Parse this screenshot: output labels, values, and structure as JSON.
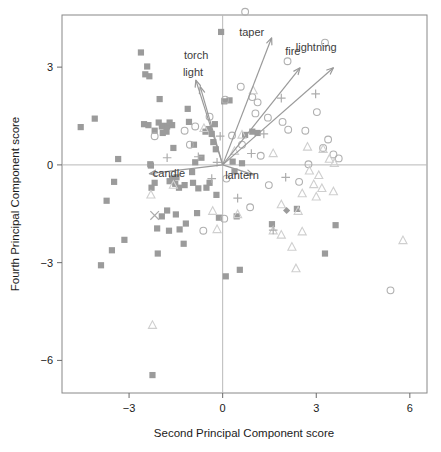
{
  "chart_data": {
    "type": "scatter",
    "title": "",
    "subtitle": "",
    "xlabel": "Second Principal Component score",
    "ylabel": "Fourth Principal Component score",
    "xlim": [
      -5.15,
      6.55
    ],
    "ylim": [
      -7.0,
      4.6
    ],
    "xticks": [
      -3,
      0,
      3,
      6
    ],
    "xtick_labels": [
      "−3",
      "0",
      "3",
      "6"
    ],
    "yticks": [
      3,
      0,
      -3,
      -6
    ],
    "ytick_labels": [
      "3",
      "0",
      "−3",
      "−6"
    ],
    "grid": false,
    "reference_lines": {
      "vertical_x": 0,
      "horizontal_y": 0,
      "color": "#b9b9b9"
    },
    "legend": {
      "position": "none",
      "entries": []
    },
    "annotations": [
      {
        "text": "torch",
        "x": -0.85,
        "y": 3.25
      },
      {
        "text": "light",
        "x": -0.95,
        "y": 2.72
      },
      {
        "text": "taper",
        "x": 0.93,
        "y": 3.95
      },
      {
        "text": "fire",
        "x": 2.25,
        "y": 3.37
      },
      {
        "text": "lightning",
        "x": 3.0,
        "y": 3.5
      },
      {
        "text": "candle",
        "x": -1.72,
        "y": -0.38
      },
      {
        "text": "lantern",
        "x": 0.62,
        "y": -0.42
      }
    ],
    "loading_vectors": {
      "origin": [
        0,
        0
      ],
      "color": "#9a9a9a",
      "items": [
        {
          "name": "torch",
          "x": -0.86,
          "y": 2.6
        },
        {
          "name": "light",
          "x": -0.72,
          "y": 2.4
        },
        {
          "name": "taper",
          "x": 1.57,
          "y": 3.9
        },
        {
          "name": "fire",
          "x": 2.48,
          "y": 2.98
        },
        {
          "name": "lightning",
          "x": 3.55,
          "y": 2.98
        },
        {
          "name": "candle",
          "x": -2.35,
          "y": -0.27
        },
        {
          "name": "lantern",
          "x": 0.98,
          "y": -0.3
        }
      ]
    },
    "series": [
      {
        "name": "square",
        "marker": "filled-square",
        "color": "#9b9b9b",
        "points": [
          [
            -4.55,
            1.16
          ],
          [
            -4.1,
            1.42
          ],
          [
            -3.35,
            0.18
          ],
          [
            -3.48,
            -0.52
          ],
          [
            -3.72,
            -1.1
          ],
          [
            -3.55,
            -2.62
          ],
          [
            -3.9,
            -3.08
          ],
          [
            -3.15,
            -2.3
          ],
          [
            -2.62,
            3.45
          ],
          [
            -2.42,
            3.02
          ],
          [
            -2.35,
            2.72
          ],
          [
            -2.48,
            2.78
          ],
          [
            -2.52,
            1.25
          ],
          [
            -2.38,
            1.22
          ],
          [
            -2.3,
            -0.02
          ],
          [
            -2.28,
            -0.7
          ],
          [
            -2.18,
            1.05
          ],
          [
            -2.02,
            2.02
          ],
          [
            -2.05,
            1.3
          ],
          [
            -1.95,
            1.18
          ],
          [
            -1.88,
            1.2
          ],
          [
            -1.78,
            1.18
          ],
          [
            -1.7,
            1.3
          ],
          [
            -1.62,
            1.22
          ],
          [
            -1.92,
            0.98
          ],
          [
            -1.8,
            1.02
          ],
          [
            -1.58,
            0.52
          ],
          [
            -1.52,
            -0.58
          ],
          [
            -1.4,
            -0.7
          ],
          [
            -1.48,
            -0.38
          ],
          [
            -1.62,
            -0.42
          ],
          [
            -1.7,
            -0.5
          ],
          [
            -1.95,
            -1.58
          ],
          [
            -1.78,
            -1.4
          ],
          [
            -2.1,
            -1.95
          ],
          [
            -1.72,
            -2.02
          ],
          [
            -2.08,
            -2.72
          ],
          [
            -1.5,
            -1.52
          ],
          [
            -1.38,
            -1.98
          ],
          [
            -1.25,
            -2.42
          ],
          [
            -1.18,
            -1.8
          ],
          [
            -1.12,
            1.72
          ],
          [
            -1.08,
            1.32
          ],
          [
            -0.92,
            0.62
          ],
          [
            -0.88,
            0.08
          ],
          [
            -0.98,
            -0.22
          ],
          [
            -0.95,
            -0.55
          ],
          [
            -0.82,
            -1.48
          ],
          [
            -0.78,
            -0.72
          ],
          [
            -0.68,
            0.22
          ],
          [
            -0.55,
            1.02
          ],
          [
            -0.45,
            1.1
          ],
          [
            -0.35,
            0.95
          ],
          [
            -0.3,
            0.7
          ],
          [
            -0.25,
            1.25
          ],
          [
            -0.22,
            0.48
          ],
          [
            -0.2,
            -0.92
          ],
          [
            -0.12,
            -1.62
          ],
          [
            -0.05,
            4.08
          ],
          [
            0.05,
            1.95
          ],
          [
            0.1,
            -3.42
          ],
          [
            0.22,
            1.98
          ],
          [
            0.32,
            0.1
          ],
          [
            0.38,
            -0.2
          ],
          [
            0.45,
            -1.58
          ],
          [
            0.55,
            -3.22
          ],
          [
            0.62,
            0.05
          ],
          [
            0.72,
            0.92
          ],
          [
            0.95,
            1.02
          ],
          [
            1.12,
            0.98
          ],
          [
            1.58,
            -1.82
          ],
          [
            2.38,
            -1.35
          ],
          [
            3.28,
            -2.72
          ],
          [
            3.62,
            -1.85
          ],
          [
            -2.25,
            -6.45
          ],
          [
            -0.52,
            -0.7
          ],
          [
            -0.42,
            -0.55
          ],
          [
            -1.22,
            -0.62
          ],
          [
            -2.18,
            -0.55
          ],
          [
            -2.32,
            0.02
          ]
        ]
      },
      {
        "name": "circle",
        "marker": "open-circle",
        "color": "#b0b0b0",
        "points": [
          [
            0.72,
            4.7
          ],
          [
            3.28,
            3.75
          ],
          [
            2.08,
            3.18
          ],
          [
            0.58,
            2.4
          ],
          [
            0.95,
            2.08
          ],
          [
            1.12,
            1.92
          ],
          [
            0.08,
            2.0
          ],
          [
            -0.42,
            1.48
          ],
          [
            -0.88,
            1.18
          ],
          [
            -1.22,
            1.05
          ],
          [
            -2.18,
            0.88
          ],
          [
            -1.05,
            0.62
          ],
          [
            0.3,
            0.9
          ],
          [
            1.05,
            1.58
          ],
          [
            1.45,
            1.45
          ],
          [
            1.92,
            1.32
          ],
          [
            2.1,
            1.08
          ],
          [
            2.65,
            1.05
          ],
          [
            3.02,
            1.62
          ],
          [
            3.38,
            0.78
          ],
          [
            3.22,
            0.52
          ],
          [
            3.55,
            0.32
          ],
          [
            3.72,
            0.2
          ],
          [
            2.75,
            0.02
          ],
          [
            1.48,
            -0.62
          ],
          [
            0.88,
            -1.3
          ],
          [
            0.05,
            -1.65
          ],
          [
            -0.62,
            -2.02
          ],
          [
            5.38,
            -3.85
          ],
          [
            0.12,
            -0.42
          ],
          [
            0.62,
            0.62
          ],
          [
            1.22,
            0.28
          ],
          [
            2.45,
            -0.52
          ]
        ]
      },
      {
        "name": "triangle",
        "marker": "open-triangle",
        "color": "#cfcfcf",
        "points": [
          [
            0.98,
            2.28
          ],
          [
            -0.6,
            1.12
          ],
          [
            0.62,
            0.92
          ],
          [
            0.38,
            0.42
          ],
          [
            1.62,
            0.35
          ],
          [
            2.72,
            0.55
          ],
          [
            3.22,
            0.48
          ],
          [
            3.42,
            0.18
          ],
          [
            3.58,
            0.05
          ],
          [
            2.78,
            -0.18
          ],
          [
            3.08,
            -0.32
          ],
          [
            2.92,
            -0.6
          ],
          [
            3.18,
            -0.72
          ],
          [
            3.55,
            -0.82
          ],
          [
            2.55,
            -0.88
          ],
          [
            1.88,
            -1.22
          ],
          [
            2.42,
            -1.42
          ],
          [
            1.62,
            -2.02
          ],
          [
            1.88,
            -2.15
          ],
          [
            2.55,
            -2.05
          ],
          [
            2.22,
            -2.52
          ],
          [
            2.35,
            -3.18
          ],
          [
            5.78,
            -2.32
          ],
          [
            -0.32,
            -1.42
          ],
          [
            -0.18,
            -1.98
          ],
          [
            -2.3,
            -0.92
          ],
          [
            -1.58,
            -0.62
          ],
          [
            -2.25,
            -4.92
          ],
          [
            0.48,
            -1.52
          ],
          [
            3.0,
            -0.98
          ]
        ]
      },
      {
        "name": "plus",
        "marker": "plus",
        "color": "#adadad",
        "points": [
          [
            1.88,
            2.05
          ],
          [
            2.98,
            2.18
          ],
          [
            -0.08,
            0.88
          ],
          [
            -0.78,
            0.25
          ],
          [
            -1.78,
            0.22
          ],
          [
            -0.18,
            0.08
          ],
          [
            0.92,
            0.35
          ],
          [
            2.02,
            -0.38
          ],
          [
            1.62,
            -2.0
          ],
          [
            -0.35,
            -0.42
          ],
          [
            0.48,
            -1.02
          ],
          [
            1.32,
            0.95
          ]
        ]
      },
      {
        "name": "cross",
        "marker": "x",
        "color": "#aaaaaa",
        "points": [
          [
            -2.18,
            -1.55
          ]
        ]
      },
      {
        "name": "diamond",
        "marker": "filled-diamond",
        "color": "#9b9b9b",
        "points": [
          [
            2.05,
            -1.4
          ]
        ]
      }
    ]
  },
  "figure": {
    "background": "#ffffff",
    "frame_color": "#888888"
  }
}
